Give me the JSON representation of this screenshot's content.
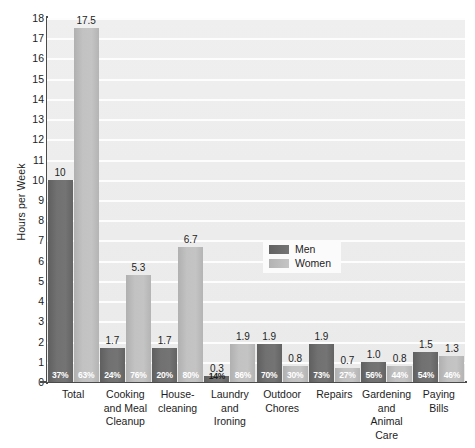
{
  "chart_data": {
    "type": "bar",
    "title": "",
    "subtitle": "",
    "xlabel": "",
    "ylabel": "Hours per Week",
    "ylim": [
      0,
      18
    ],
    "ytick_step": 1,
    "yticks": [
      "18",
      "17",
      "16",
      "15",
      "14",
      "13",
      "12",
      "11",
      "10",
      "9",
      "8",
      "7",
      "6",
      "5",
      "4",
      "3",
      "2",
      "1",
      "0"
    ],
    "grid": true,
    "grid_axis": "y",
    "legend_position": "inside-center-right",
    "categories": [
      "Total",
      "Cooking and Meal Cleanup",
      "House-cleaning",
      "Laundry and Ironing",
      "Outdoor Chores",
      "Repairs",
      "Gardening and Animal Care",
      "Paying Bills"
    ],
    "category_lines": [
      [
        "Total"
      ],
      [
        "Cooking",
        "and Meal",
        "Cleanup"
      ],
      [
        "House-",
        "cleaning"
      ],
      [
        "Laundry",
        "and",
        "Ironing"
      ],
      [
        "Outdoor",
        "Chores"
      ],
      [
        "Repairs"
      ],
      [
        "Gardening",
        "and",
        "Animal Care"
      ],
      [
        "Paying",
        "Bills"
      ]
    ],
    "series": [
      {
        "name": "Men",
        "color": "#707070",
        "values": [
          10,
          1.7,
          1.7,
          0.3,
          1.9,
          1.9,
          1.0,
          1.5
        ],
        "value_labels": [
          "10",
          "1.7",
          "1.7",
          "0.3",
          "1.9",
          "1.9",
          "1.0",
          "1.5"
        ],
        "share_labels": [
          "37%",
          "24%",
          "20%",
          "14%",
          "70%",
          "73%",
          "56%",
          "54%"
        ]
      },
      {
        "name": "Women",
        "color": "#c0c0c0",
        "values": [
          17.5,
          5.3,
          6.7,
          1.9,
          0.8,
          0.7,
          0.8,
          1.3
        ],
        "value_labels": [
          "17.5",
          "5.3",
          "6.7",
          "1.9",
          "0.8",
          "0.7",
          "0.8",
          "1.3"
        ],
        "share_labels": [
          "63%",
          "76%",
          "80%",
          "86%",
          "30%",
          "27%",
          "44%",
          "46%"
        ]
      }
    ]
  },
  "legend": {
    "items": [
      {
        "label": "Men"
      },
      {
        "label": "Women"
      }
    ]
  }
}
